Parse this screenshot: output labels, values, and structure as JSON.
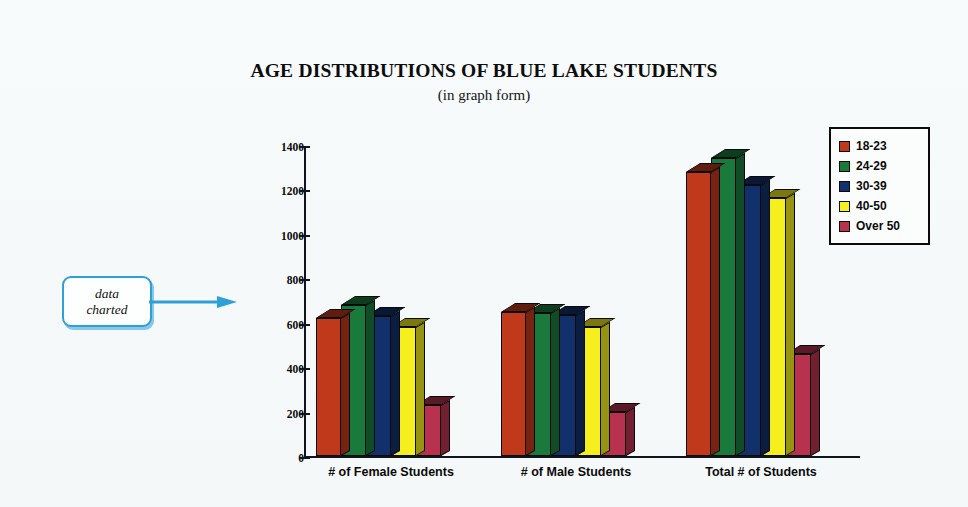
{
  "title": "AGE DISTRIBUTIONS OF BLUE LAKE STUDENTS",
  "subtitle": "(in graph form)",
  "callout": {
    "line1": "data",
    "line2": "charted",
    "arrow_icon": "right-arrow-icon"
  },
  "chart_data": {
    "type": "bar",
    "title": "AGE DISTRIBUTIONS OF BLUE LAKE STUDENTS",
    "subtitle": "(in graph form)",
    "xlabel": "",
    "ylabel": "",
    "ylim": [
      0,
      1400
    ],
    "ytick_step": 200,
    "yticks": [
      0,
      200,
      400,
      600,
      800,
      1000,
      1200,
      1400
    ],
    "grid": false,
    "legend_position": "right",
    "categories": [
      "# of Female Students",
      "# of Male Students",
      "Total # of Students"
    ],
    "series": [
      {
        "name": "18-23",
        "color": "#c0391b",
        "values": [
          620,
          650,
          1280
        ]
      },
      {
        "name": "24-29",
        "color": "#1a7a3c",
        "values": [
          680,
          645,
          1340
        ]
      },
      {
        "name": "30-39",
        "color": "#12306b",
        "values": [
          630,
          635,
          1220
        ]
      },
      {
        "name": "40-50",
        "color": "#f5ef1e",
        "values": [
          580,
          580,
          1160
        ]
      },
      {
        "name": "Over 50",
        "color": "#b8324f",
        "values": [
          230,
          200,
          460
        ]
      }
    ]
  },
  "colors": {
    "background": "#f7fafb",
    "axis": "#10141c",
    "outline": "#0a0a0a",
    "callout_blue": "#2f9fd8"
  }
}
